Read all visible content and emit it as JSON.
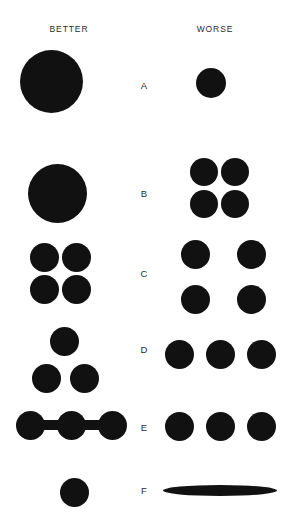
{
  "figure": {
    "background_color": "#ffffff",
    "shape_color": "#111111",
    "text_color": "#2b2b2b"
  },
  "columns": {
    "better_label": "BETTER",
    "worse_label": "WORSE"
  },
  "rows": [
    {
      "id": "A",
      "label": "A",
      "criterion": "particle size",
      "better": {
        "description": "one large circle",
        "count": 1,
        "diameter_px": 63
      },
      "worse": {
        "description": "one small circle",
        "count": 1,
        "diameter_px": 30
      }
    },
    {
      "id": "B",
      "label": "B",
      "criterion": "agglomeration",
      "better": {
        "description": "one large circle",
        "count": 1,
        "diameter_px": 59
      },
      "worse": {
        "description": "four medium circles in a tight 2 by 2 cluster",
        "count": 4,
        "diameter_px": 28
      }
    },
    {
      "id": "C",
      "label": "C",
      "criterion": "spacing",
      "better": {
        "description": "four circles in a tight 2 by 2 grid",
        "count": 4,
        "diameter_px": 29
      },
      "worse": {
        "description": "four circles in a widely spaced 2 by 2 grid",
        "count": 4,
        "diameter_px": 29
      }
    },
    {
      "id": "D",
      "label": "D",
      "criterion": "arrangement",
      "better": {
        "description": "three circles in a triangular arrangement",
        "count": 3,
        "diameter_px": 29
      },
      "worse": {
        "description": "three circles in a straight horizontal row",
        "count": 3,
        "diameter_px": 29
      }
    },
    {
      "id": "E",
      "label": "E",
      "criterion": "connectivity",
      "better": {
        "description": "three circles joined by connecting bars",
        "count": 3,
        "diameter_px": 29,
        "connectors": 2
      },
      "worse": {
        "description": "three separate unconnected circles",
        "count": 3,
        "diameter_px": 29,
        "connectors": 0
      }
    },
    {
      "id": "F",
      "label": "F",
      "criterion": "shape aspect ratio",
      "better": {
        "description": "one round circle",
        "count": 1,
        "diameter_px": 29
      },
      "worse": {
        "description": "one highly elongated flat ellipse",
        "count": 1,
        "width_px": 114,
        "height_px": 11
      }
    }
  ]
}
